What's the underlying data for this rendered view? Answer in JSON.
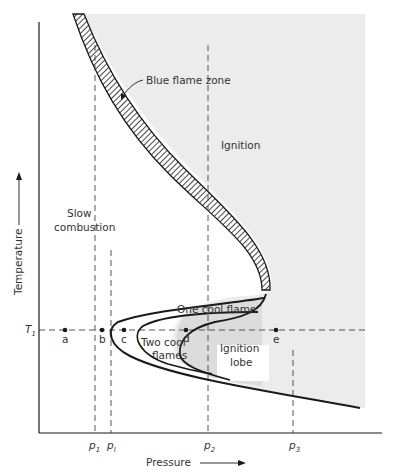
{
  "diagram": {
    "type": "pressure-temperature ignition diagram",
    "axes": {
      "x_label": "Pressure",
      "y_label": "Temperature"
    },
    "regions": {
      "blue_flame_zone": "Blue flame zone",
      "ignition": "Ignition",
      "slow_combustion_line1": "Slow",
      "slow_combustion_line2": "combustion",
      "one_cool_flame": "One cool flame",
      "two_cool_flames_line1": "Two cool",
      "two_cool_flames_line2": "flames",
      "ignition_lobe_line1": "Ignition",
      "ignition_lobe_line2": "lobe"
    },
    "temperature_marker": {
      "main": "T",
      "sub": "1"
    },
    "points": [
      {
        "label": "a"
      },
      {
        "label": "b"
      },
      {
        "label": "c"
      },
      {
        "label": "d"
      },
      {
        "label": "e"
      }
    ],
    "pressure_markers": [
      {
        "main": "p",
        "sub": "1"
      },
      {
        "main": "p",
        "sub": "l"
      },
      {
        "main": "p",
        "sub": "2"
      },
      {
        "main": "p",
        "sub": "3"
      }
    ],
    "colors": {
      "ink": "#1a1a1a",
      "shading": "#ececec",
      "lobe_shading": "#dcdcdc",
      "background": "#ffffff"
    }
  }
}
